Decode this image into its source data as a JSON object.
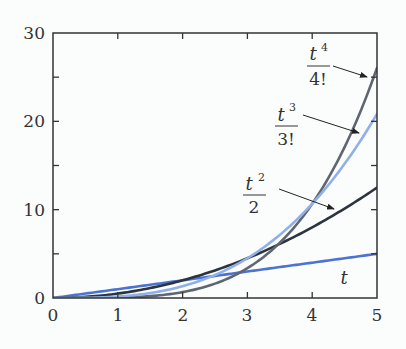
{
  "chart_data": {
    "type": "line",
    "title": "",
    "xlabel": "",
    "ylabel": "",
    "xlim": [
      0,
      5
    ],
    "ylim": [
      0,
      30
    ],
    "x_ticks": [
      0,
      1,
      2,
      3,
      4,
      5
    ],
    "x_tick_labels": [
      "0",
      "1",
      "2",
      "3",
      "4",
      "5"
    ],
    "y_ticks": [
      0,
      5,
      10,
      15,
      20,
      25,
      30
    ],
    "y_tick_labels": [
      "0",
      "",
      "10",
      "",
      "20",
      "",
      "30"
    ],
    "grid": false,
    "legend": "none (curves labeled by inline annotations with arrows)",
    "x": [
      0,
      0.5,
      1,
      1.5,
      2,
      2.5,
      3,
      3.5,
      4,
      4.5,
      5
    ],
    "series": [
      {
        "name": "t",
        "label_num": "t",
        "label_den": "",
        "color": "#4a74d0",
        "values": [
          0,
          0.5,
          1,
          1.5,
          2,
          2.5,
          3,
          3.5,
          4,
          4.5,
          5
        ]
      },
      {
        "name": "t^2/2",
        "label_num": "t",
        "label_exp": "2",
        "label_den": "2",
        "color": "#2c3440",
        "values": [
          0,
          0.125,
          0.5,
          1.125,
          2,
          3.125,
          4.5,
          6.125,
          8,
          10.125,
          12.5
        ]
      },
      {
        "name": "t^3/3!",
        "label_num": "t",
        "label_exp": "3",
        "label_den": "3!",
        "color": "#8fb0e8",
        "values": [
          0,
          0.021,
          0.167,
          0.563,
          1.333,
          2.604,
          4.5,
          7.146,
          10.667,
          15.188,
          20.833
        ]
      },
      {
        "name": "t^4/4!",
        "label_num": "t",
        "label_exp": "4",
        "label_den": "4!",
        "color": "#5f6670",
        "values": [
          0,
          0.003,
          0.042,
          0.211,
          0.667,
          1.628,
          3.375,
          6.253,
          10.667,
          17.086,
          26.042
        ]
      }
    ],
    "annotations": [
      {
        "text": "t",
        "position": "below t line near x=4.5"
      },
      {
        "text": "t^2/2",
        "arrow_to": [
          4.35,
          10.5
        ]
      },
      {
        "text": "t^3/3!",
        "arrow_to": [
          4.65,
          17.2
        ]
      },
      {
        "text": "t^4/4!",
        "arrow_to": [
          4.9,
          25.0
        ]
      }
    ]
  },
  "labels": {
    "x": [
      "0",
      "1",
      "2",
      "3",
      "4",
      "5"
    ],
    "y": [
      "0",
      "10",
      "20",
      "30"
    ],
    "t_label": "t",
    "t2_num": "t",
    "t2_exp": "2",
    "t2_den": "2",
    "t3_num": "t",
    "t3_exp": "3",
    "t3_den": "3!",
    "t4_num": "t",
    "t4_exp": "4",
    "t4_den": "4!"
  }
}
